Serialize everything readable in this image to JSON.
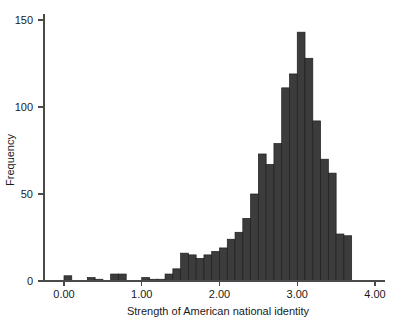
{
  "chart_data": {
    "type": "bar",
    "title": "",
    "subtitle": "",
    "xlabel": "Strength of American national identity",
    "ylabel": "Frequency",
    "xlim": [
      -0.2,
      4.2
    ],
    "ylim": [
      0,
      155
    ],
    "xticks": [
      "0.00",
      "1.00",
      "2.00",
      "3.00",
      "4.00"
    ],
    "xtick_values": [
      0,
      1,
      2,
      3,
      4
    ],
    "yticks": [
      "0",
      "50",
      "100",
      "150"
    ],
    "ytick_values": [
      0,
      50,
      100,
      150
    ],
    "grid": false,
    "legend": null,
    "bin_width": 0.1,
    "bar_color": "#3c3c3c",
    "bar_edge_color": "#1e1e1e",
    "axis_color": "#4a4a4a",
    "bins": [
      {
        "x0": 0.0,
        "x1": 0.1,
        "value": 3
      },
      {
        "x0": 0.1,
        "x1": 0.2,
        "value": 0
      },
      {
        "x0": 0.2,
        "x1": 0.3,
        "value": 0
      },
      {
        "x0": 0.3,
        "x1": 0.4,
        "value": 2
      },
      {
        "x0": 0.4,
        "x1": 0.5,
        "value": 1
      },
      {
        "x0": 0.5,
        "x1": 0.6,
        "value": 0
      },
      {
        "x0": 0.6,
        "x1": 0.7,
        "value": 4
      },
      {
        "x0": 0.7,
        "x1": 0.8,
        "value": 4
      },
      {
        "x0": 0.8,
        "x1": 0.9,
        "value": 0
      },
      {
        "x0": 0.9,
        "x1": 1.0,
        "value": 0
      },
      {
        "x0": 1.0,
        "x1": 1.1,
        "value": 2
      },
      {
        "x0": 1.1,
        "x1": 1.2,
        "value": 1
      },
      {
        "x0": 1.2,
        "x1": 1.3,
        "value": 1
      },
      {
        "x0": 1.3,
        "x1": 1.4,
        "value": 4
      },
      {
        "x0": 1.4,
        "x1": 1.5,
        "value": 7
      },
      {
        "x0": 1.5,
        "x1": 1.6,
        "value": 16
      },
      {
        "x0": 1.6,
        "x1": 1.7,
        "value": 15
      },
      {
        "x0": 1.7,
        "x1": 1.8,
        "value": 13
      },
      {
        "x0": 1.8,
        "x1": 1.9,
        "value": 15
      },
      {
        "x0": 1.9,
        "x1": 2.0,
        "value": 17
      },
      {
        "x0": 2.0,
        "x1": 2.1,
        "value": 19
      },
      {
        "x0": 2.1,
        "x1": 2.2,
        "value": 24
      },
      {
        "x0": 2.2,
        "x1": 2.3,
        "value": 28
      },
      {
        "x0": 2.3,
        "x1": 2.4,
        "value": 36
      },
      {
        "x0": 2.4,
        "x1": 2.5,
        "value": 50
      },
      {
        "x0": 2.5,
        "x1": 2.6,
        "value": 73
      },
      {
        "x0": 2.6,
        "x1": 2.7,
        "value": 67
      },
      {
        "x0": 2.7,
        "x1": 2.8,
        "value": 79
      },
      {
        "x0": 2.8,
        "x1": 2.9,
        "value": 111
      },
      {
        "x0": 2.9,
        "x1": 3.0,
        "value": 119
      },
      {
        "x0": 3.0,
        "x1": 3.1,
        "value": 143
      },
      {
        "x0": 3.1,
        "x1": 3.2,
        "value": 128
      },
      {
        "x0": 3.2,
        "x1": 3.3,
        "value": 92
      },
      {
        "x0": 3.3,
        "x1": 3.4,
        "value": 70
      },
      {
        "x0": 3.4,
        "x1": 3.5,
        "value": 62
      },
      {
        "x0": 3.5,
        "x1": 3.6,
        "value": 27
      },
      {
        "x0": 3.6,
        "x1": 3.7,
        "value": 26
      }
    ]
  }
}
